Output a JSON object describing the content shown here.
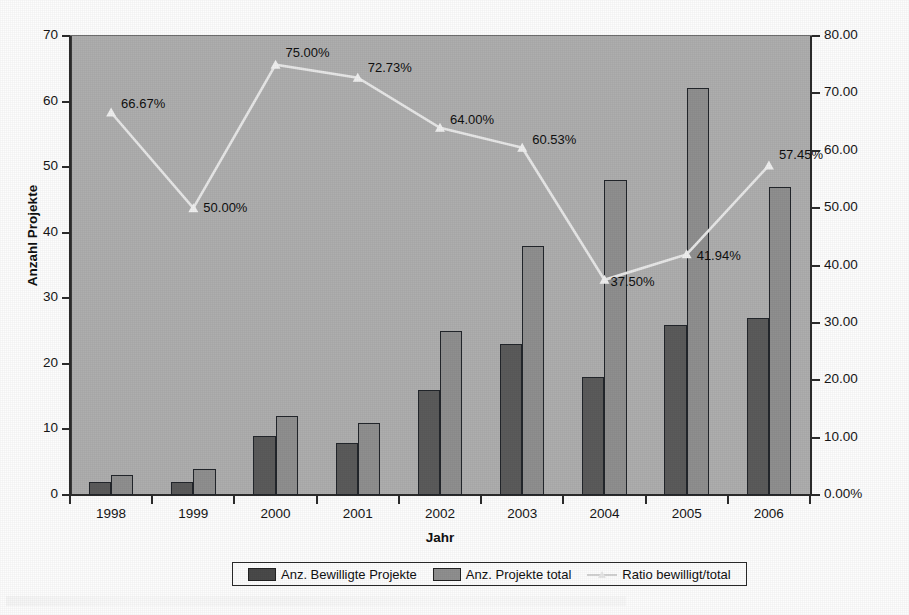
{
  "chart_data": {
    "type": "bar",
    "title": "",
    "subtitle": "",
    "xlabel": "Jahr",
    "ylabel": "Anzahl Projekte",
    "y2label": "",
    "categories": [
      "1998",
      "1999",
      "2000",
      "2001",
      "2002",
      "2003",
      "2004",
      "2005",
      "2006"
    ],
    "series": [
      {
        "name": "Anz. Bewilligte Projekte",
        "type": "bar",
        "axis": "left",
        "color": "#5b5b5b",
        "values": [
          2,
          2,
          9,
          8,
          16,
          23,
          18,
          26,
          27
        ]
      },
      {
        "name": "Anz. Projekte total",
        "type": "bar",
        "axis": "left",
        "color": "#8f8f8f",
        "values": [
          3,
          4,
          12,
          11,
          25,
          38,
          48,
          62,
          47
        ]
      },
      {
        "name": "Ratio bewilligt/total",
        "type": "line",
        "axis": "right",
        "color": "#e8e8e8",
        "values": [
          66.67,
          50.0,
          75.0,
          72.73,
          64.0,
          60.53,
          37.5,
          41.94,
          57.45
        ],
        "labels": [
          "66.67%",
          "50.00%",
          "75.00%",
          "72.73%",
          "64.00%",
          "60.53%",
          "37.50%",
          "41.94%",
          "57.45%"
        ]
      }
    ],
    "ylim": [
      0,
      70
    ],
    "yticks": [
      0,
      10,
      20,
      30,
      40,
      50,
      60,
      70
    ],
    "ytick_labels": [
      "0",
      "10",
      "20",
      "30",
      "40",
      "50",
      "60",
      "70"
    ],
    "y2lim": [
      0,
      80
    ],
    "y2ticks": [
      0,
      10,
      20,
      30,
      40,
      50,
      60,
      70,
      80
    ],
    "y2tick_labels": [
      "0.00%",
      "10.00",
      "20.00",
      "30.00",
      "40.00",
      "50.00",
      "60.00",
      "70.00",
      "80.00"
    ],
    "grid": false,
    "legend_position": "bottom",
    "plot_background": "#aeaeae"
  },
  "legend": {
    "items": [
      {
        "label": "Anz. Bewilligte Projekte",
        "swatch": "approved-swatch"
      },
      {
        "label": "Anz. Projekte total",
        "swatch": "total-swatch"
      },
      {
        "label": "Ratio bewilligt/total",
        "swatch": "line-marker"
      }
    ]
  }
}
